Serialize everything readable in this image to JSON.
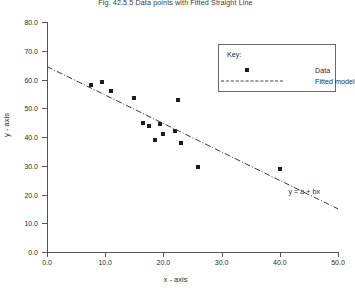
{
  "chart_data": {
    "type": "scatter",
    "title": "Fig. 42.5.5 Data points with Fitted Straight Line",
    "xlabel": "x - axis",
    "ylabel": "y - axis",
    "xlim": [
      0,
      50
    ],
    "ylim": [
      0,
      80
    ],
    "xticks": [
      "0.0",
      "10.0",
      "20.0",
      "30.0",
      "40.0",
      "50.0"
    ],
    "xtick_values": [
      0,
      10,
      20,
      30,
      40,
      50
    ],
    "yticks": [
      "0.0",
      "10.0",
      "20.0",
      "30.0",
      "40.0",
      "50.0",
      "60.0",
      "70.0",
      "80.0"
    ],
    "ytick_values": [
      0,
      10,
      20,
      30,
      40,
      50,
      60,
      70,
      80
    ],
    "grid": false,
    "legend_position": "upper-right",
    "series": [
      {
        "name": "Data",
        "type": "scatter",
        "marker": "square",
        "color": "#1c1c1c",
        "points": [
          {
            "x": 7.5,
            "y": 58.0
          },
          {
            "x": 9.5,
            "y": 59.0
          },
          {
            "x": 11.0,
            "y": 56.0
          },
          {
            "x": 15.0,
            "y": 53.5
          },
          {
            "x": 16.5,
            "y": 45.0
          },
          {
            "x": 17.5,
            "y": 44.0
          },
          {
            "x": 18.5,
            "y": 39.0
          },
          {
            "x": 19.5,
            "y": 44.5
          },
          {
            "x": 20.0,
            "y": 41.0
          },
          {
            "x": 22.0,
            "y": 42.0
          },
          {
            "x": 22.5,
            "y": 53.0
          },
          {
            "x": 23.0,
            "y": 38.0
          },
          {
            "x": 26.0,
            "y": 29.5
          },
          {
            "x": 40.0,
            "y": 29.0
          }
        ]
      },
      {
        "name": "Fitted model",
        "type": "line",
        "style": "dash-dot",
        "color": "#3a3a3a",
        "endpoints": [
          {
            "x": 0.0,
            "y": 64.5
          },
          {
            "x": 50.0,
            "y": 15.0
          }
        ],
        "equation": "y = a + bx",
        "intercept": 64.5,
        "slope": -0.99
      }
    ],
    "annotations": [
      {
        "text": "y = a + bx",
        "x": 41.5,
        "y": 22.5
      }
    ]
  },
  "legend": {
    "title": "Key:",
    "entries": [
      {
        "label": "Data",
        "symbol": "square-marker"
      },
      {
        "label": "Fitted model",
        "symbol": "dash-dot-line"
      }
    ]
  }
}
